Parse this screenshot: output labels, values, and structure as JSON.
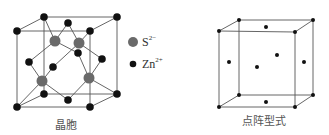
{
  "left_figure": {
    "caption": "晶胞",
    "legend": [
      {
        "ion": "S",
        "charge": "2−",
        "marker": "large-grey-circle",
        "color": "#666666"
      },
      {
        "ion": "Zn",
        "charge": "2+",
        "marker": "small-black-circle",
        "color": "#111111"
      }
    ]
  },
  "right_figure": {
    "caption": "点阵型式"
  },
  "colors": {
    "line": "#555555",
    "zn": "#111111",
    "s": "#6a6a6a",
    "caption": "#555555"
  }
}
